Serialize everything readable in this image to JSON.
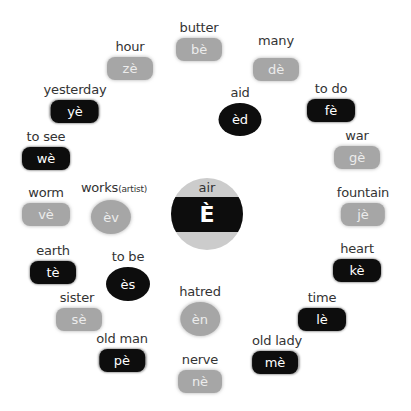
{
  "center": {
    "label": "air",
    "letter": "È"
  },
  "items": [
    {
      "label": "butter",
      "sound": "bè",
      "style": "gray",
      "shape": "pill"
    },
    {
      "label": "hour",
      "sound": "zè",
      "style": "gray",
      "shape": "pill"
    },
    {
      "label": "many",
      "sound": "dè",
      "style": "gray",
      "shape": "pill"
    },
    {
      "label": "yesterday",
      "sound": "yè",
      "style": "black",
      "shape": "pill"
    },
    {
      "label": "aid",
      "sound": "èd",
      "style": "black",
      "shape": "oval"
    },
    {
      "label": "to do",
      "sound": "fè",
      "style": "black",
      "shape": "pill"
    },
    {
      "label": "to see",
      "sound": "wè",
      "style": "black",
      "shape": "pill"
    },
    {
      "label": "war",
      "sound": "gè",
      "style": "gray",
      "shape": "pill"
    },
    {
      "label": "worm",
      "sound": "vè",
      "style": "gray",
      "shape": "pill"
    },
    {
      "label": "works",
      "label_note": "(artist)",
      "sound": "èv",
      "style": "gray",
      "shape": "oval"
    },
    {
      "label": "fountain",
      "sound": "jè",
      "style": "gray",
      "shape": "pill"
    },
    {
      "label": "earth",
      "sound": "tè",
      "style": "black",
      "shape": "pill"
    },
    {
      "label": "to be",
      "sound": "ès",
      "style": "black",
      "shape": "oval"
    },
    {
      "label": "heart",
      "sound": "kè",
      "style": "black",
      "shape": "pill"
    },
    {
      "label": "sister",
      "sound": "sè",
      "style": "gray",
      "shape": "pill"
    },
    {
      "label": "hatred",
      "sound": "èn",
      "style": "gray",
      "shape": "oval"
    },
    {
      "label": "time",
      "sound": "lè",
      "style": "black",
      "shape": "pill"
    },
    {
      "label": "old man",
      "sound": "pè",
      "style": "black",
      "shape": "pill"
    },
    {
      "label": "old lady",
      "sound": "mè",
      "style": "black",
      "shape": "pill"
    },
    {
      "label": "nerve",
      "sound": "nè",
      "style": "gray",
      "shape": "pill"
    }
  ],
  "colors": {
    "gray": "#a6a6a6",
    "black": "#0d0d0d",
    "center_ring": "#cccccc",
    "label_text": "#333333"
  }
}
